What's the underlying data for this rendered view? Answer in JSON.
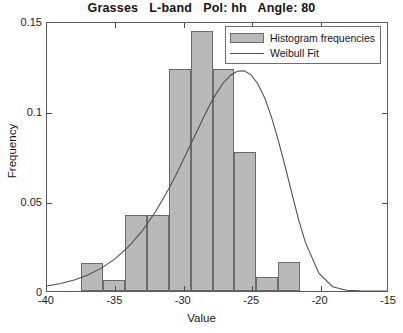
{
  "chart_data": {
    "type": "bar",
    "title": "Grasses   L-band   Pol: hh   Angle: 80",
    "xlabel": "Value",
    "ylabel": "Frequency",
    "xlim": [
      -40,
      -15
    ],
    "ylim": [
      0,
      0.15
    ],
    "xticks": [
      -40,
      -35,
      -30,
      -25,
      -20,
      -15
    ],
    "xticklabels": [
      "-40",
      "-35",
      "-30",
      "-25",
      "-20",
      "-15"
    ],
    "yticks": [
      0,
      0.05,
      0.1,
      0.15
    ],
    "yticklabels": [
      "0",
      "0.05",
      "0.1",
      "0.15"
    ],
    "grid": false,
    "legend_position": "upper right",
    "bar_color": "#b9b9b9",
    "bar_edge_color": "#6b6b6b",
    "line_color": "#4f4f4f",
    "bin_width": 1.6,
    "bin_edges": [
      -37.5,
      -35.9,
      -34.3,
      -32.7,
      -31.1,
      -29.5,
      -27.9,
      -26.3,
      -24.7,
      -23.1,
      -21.5,
      -19.9
    ],
    "bin_centers": [
      -36.7,
      -35.1,
      -33.5,
      -31.9,
      -30.3,
      -28.7,
      -27.1,
      -25.5,
      -23.9,
      -22.3,
      -20.7
    ],
    "series": [
      {
        "name": "Histogram frequencies",
        "type": "bar",
        "values": [
          0.0155,
          0.0062,
          0.0425,
          0.0425,
          0.1235,
          0.1445,
          0.1235,
          0.077,
          0.0078,
          0.016,
          0.0
        ]
      },
      {
        "name": "Weibull Fit",
        "type": "line",
        "x": [
          -40.0,
          -39.0,
          -38.0,
          -37.0,
          -36.0,
          -35.0,
          -34.0,
          -33.0,
          -32.0,
          -31.0,
          -30.5,
          -30.0,
          -29.5,
          -29.0,
          -28.5,
          -28.0,
          -27.5,
          -27.0,
          -26.5,
          -26.0,
          -25.5,
          -25.0,
          -24.5,
          -24.0,
          -23.5,
          -23.0,
          -22.5,
          -22.0,
          -21.5,
          -21.0,
          -20.0,
          -19.0,
          -18.0,
          -17.0,
          -16.0,
          -15.0
        ],
        "y": [
          0.0028,
          0.0042,
          0.0062,
          0.009,
          0.0128,
          0.018,
          0.0248,
          0.0336,
          0.0446,
          0.0578,
          0.0652,
          0.073,
          0.081,
          0.089,
          0.097,
          0.1046,
          0.1112,
          0.1168,
          0.1208,
          0.123,
          0.1232,
          0.121,
          0.116,
          0.1082,
          0.0975,
          0.0845,
          0.07,
          0.0548,
          0.04,
          0.0272,
          0.0098,
          0.0024,
          0.0004,
          0.0001,
          0.0,
          0.0
        ]
      }
    ]
  },
  "legend": {
    "items": [
      {
        "label": "Histogram frequencies",
        "marker": "patch"
      },
      {
        "label": "Weibull Fit",
        "marker": "line"
      }
    ]
  }
}
